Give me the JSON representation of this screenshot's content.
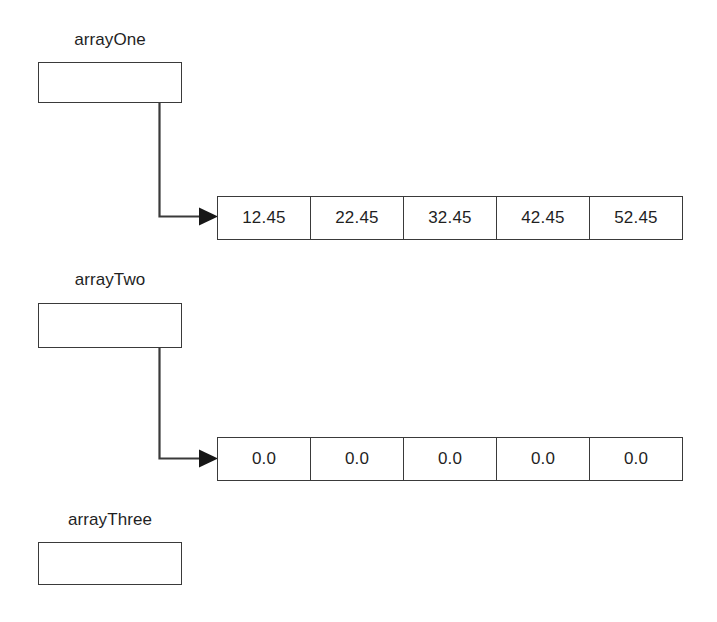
{
  "diagram": {
    "line_color": "#3a3a3a",
    "text_color": "#1f1f1f",
    "background": "#ffffff"
  },
  "variables": [
    {
      "label": "arrayOne",
      "has_pointer": true,
      "array": {
        "cells": [
          "12.45",
          "22.45",
          "32.45",
          "42.45",
          "52.45"
        ]
      }
    },
    {
      "label": "arrayTwo",
      "has_pointer": true,
      "array": {
        "cells": [
          "0.0",
          "0.0",
          "0.0",
          "0.0",
          "0.0"
        ]
      }
    },
    {
      "label": "arrayThree",
      "has_pointer": false,
      "array": null
    }
  ]
}
